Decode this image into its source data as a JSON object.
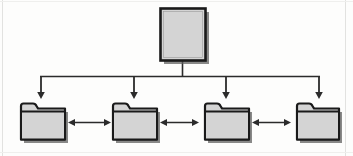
{
  "diagram": {
    "type": "tree-diagram",
    "orientation": "top-down",
    "colors": {
      "node_fill": "#d4d4d4",
      "node_border": "#1a1a1a",
      "connector": "#2b2b2b",
      "shadow": "#5c5c5c",
      "background": "#fdfdfc"
    },
    "root": {
      "icon": "document-page-icon",
      "label": "",
      "shape": "rectangle",
      "x": 160,
      "y": 8,
      "width": 45,
      "height": 52
    },
    "bus": {
      "y": 76,
      "x_start": 40,
      "x_end": 320,
      "stem_x": 182,
      "stem_top": 60,
      "drop_bottom": 98
    },
    "children": [
      {
        "id": "folder-1",
        "icon": "folder-icon",
        "label": "",
        "x": 20,
        "y": 104,
        "width": 46,
        "height": 36,
        "drop_x": 41
      },
      {
        "id": "folder-2",
        "icon": "folder-icon",
        "label": "",
        "x": 112,
        "y": 104,
        "width": 46,
        "height": 36,
        "drop_x": 134
      },
      {
        "id": "folder-3",
        "icon": "folder-icon",
        "label": "",
        "x": 200,
        "y": 104,
        "width": 46,
        "height": 36,
        "drop_x": 226
      },
      {
        "id": "folder-4",
        "icon": "folder-icon",
        "label": "",
        "x": 292,
        "y": 104,
        "width": 46,
        "height": 36,
        "drop_x": 319
      }
    ],
    "peer_links": [
      {
        "id": "link-1-2",
        "from": "folder-1",
        "to": "folder-2",
        "style": "double-arrow",
        "x1": 68,
        "x2": 110,
        "y": 122
      },
      {
        "id": "link-2-3",
        "from": "folder-2",
        "to": "folder-3",
        "style": "double-arrow",
        "x1": 160,
        "x2": 198,
        "y": 122
      },
      {
        "id": "link-3-4",
        "from": "folder-3",
        "to": "folder-4",
        "style": "double-arrow",
        "x1": 248,
        "x2": 290,
        "y": 122
      }
    ]
  }
}
